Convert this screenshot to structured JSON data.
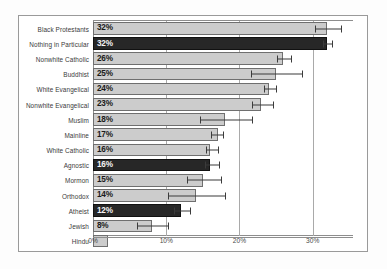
{
  "chart_data": {
    "type": "bar",
    "orientation": "horizontal",
    "title": "",
    "subtitle": "",
    "xlabel": "",
    "ylabel": "",
    "xlim": [
      0,
      35.5
    ],
    "xticks": [
      0,
      10,
      20,
      30
    ],
    "xticklabels": [
      "0%",
      "10%",
      "20%",
      "30%"
    ],
    "grid": true,
    "grid_axis": "x",
    "legend": null,
    "value_suffix": "%",
    "categories": [
      "Black Protestants",
      "Nothing in Particular",
      "Nonwhite Catholic",
      "Buddhist",
      "White Evangelical",
      "Nonwhite Evangelical",
      "Muslim",
      "Mainline",
      "White Catholic",
      "Agnostic",
      "Mormon",
      "Orthodox",
      "Atheist",
      "Jewish",
      "Hindu"
    ],
    "bars": [
      {
        "label": "Black Protestants",
        "value": 32,
        "value_label": "32%",
        "highlight": false,
        "err_low": 30.3,
        "err_high": 33.9
      },
      {
        "label": "Nothing in Particular",
        "value": 32,
        "value_label": "32%",
        "highlight": true,
        "err_low": 31.4,
        "err_high": 32.7
      },
      {
        "label": "Nonwhite Catholic",
        "value": 26,
        "value_label": "26%",
        "highlight": false,
        "err_low": 25.1,
        "err_high": 27.1
      },
      {
        "label": "Buddhist",
        "value": 25,
        "value_label": "25%",
        "highlight": false,
        "err_low": 21.6,
        "err_high": 28.6
      },
      {
        "label": "White Evangelical",
        "value": 24,
        "value_label": "24%",
        "highlight": false,
        "err_low": 23.4,
        "err_high": 25.0
      },
      {
        "label": "Nonwhite Evangelical",
        "value": 23,
        "value_label": "23%",
        "highlight": false,
        "err_low": 21.7,
        "err_high": 24.6
      },
      {
        "label": "Muslim",
        "value": 18,
        "value_label": "18%",
        "highlight": false,
        "err_low": 14.6,
        "err_high": 21.7
      },
      {
        "label": "Mainline",
        "value": 17,
        "value_label": "17%",
        "highlight": false,
        "err_low": 16.1,
        "err_high": 17.8
      },
      {
        "label": "White Catholic",
        "value": 16,
        "value_label": "16%",
        "highlight": false,
        "err_low": 15.4,
        "err_high": 17.1
      },
      {
        "label": "Agnostic",
        "value": 16,
        "value_label": "16%",
        "highlight": true,
        "err_low": 15.3,
        "err_high": 17.2
      },
      {
        "label": "Mormon",
        "value": 15,
        "value_label": "15%",
        "highlight": false,
        "err_low": 12.8,
        "err_high": 17.5
      },
      {
        "label": "Orthodox",
        "value": 14,
        "value_label": "14%",
        "highlight": false,
        "err_low": 10.2,
        "err_high": 18.0
      },
      {
        "label": "Atheist",
        "value": 12,
        "value_label": "12%",
        "highlight": true,
        "err_low": 11.1,
        "err_high": 13.2
      },
      {
        "label": "Jewish",
        "value": 8,
        "value_label": "8%",
        "highlight": false,
        "err_low": 6.0,
        "err_high": 10.2
      },
      {
        "label": "Hindu",
        "value": 2,
        "value_label": "",
        "highlight": false,
        "err_low": 2,
        "err_high": 2
      }
    ],
    "colors": {
      "bar_light": "#cccccc",
      "bar_dark": "#272727",
      "bar_edge": "#6f6f6f",
      "error_bar": "#3b3b3b",
      "grid": "#a9a9a9",
      "axis": "#8d8d8d",
      "label_on_light": "#1a1a1a",
      "label_on_dark": "#f4f4f4",
      "tick_text": "#4a4a4a",
      "category_text": "#3a3a3a",
      "background": "#ffffff",
      "page_background": "#fdfdfd",
      "figure_border": "#9a9a9a"
    }
  }
}
